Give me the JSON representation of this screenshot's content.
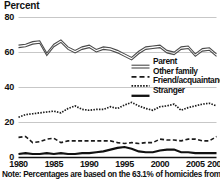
{
  "chart_data": {
    "type": "line",
    "title": "Percent",
    "xlabel": "",
    "ylabel": "Percent",
    "xlim": [
      1980,
      2008
    ],
    "ylim": [
      0,
      80
    ],
    "grid": true,
    "legend_position": "center-right",
    "x": [
      1980,
      1981,
      1982,
      1983,
      1984,
      1985,
      1986,
      1987,
      1988,
      1989,
      1990,
      1991,
      1992,
      1993,
      1994,
      1995,
      1996,
      1997,
      1998,
      1999,
      2000,
      2001,
      2002,
      2003,
      2004,
      2005,
      2006,
      2007,
      2008
    ],
    "xticks": [
      "1980",
      "1985",
      "1990",
      "1995",
      "2000",
      "2005",
      "2008"
    ],
    "xtick_values": [
      1980,
      1985,
      1990,
      1995,
      2000,
      2005,
      2008
    ],
    "yticks": [
      "0",
      "20",
      "40",
      "60",
      "80"
    ],
    "ytick_values": [
      0,
      20,
      40,
      60,
      80
    ],
    "series": [
      {
        "name": "Parent",
        "style": "double-line",
        "color": "#555555",
        "values": [
          63.5,
          64.0,
          65.5,
          66.0,
          59.0,
          64.0,
          66.5,
          62.5,
          60.5,
          62.5,
          63.5,
          61.0,
          62.5,
          62.0,
          60.5,
          58.5,
          56.5,
          60.0,
          62.5,
          63.0,
          63.5,
          60.5,
          59.5,
          62.5,
          63.0,
          58.5,
          61.5,
          62.0,
          58.5
        ]
      },
      {
        "name": "Other family",
        "style": "dashed",
        "color": "#1a1a1a",
        "values": [
          11.5,
          12.0,
          8.5,
          9.0,
          10.5,
          11.0,
          8.5,
          9.5,
          9.5,
          9.5,
          9.5,
          9.5,
          9.5,
          9.5,
          8.5,
          8.0,
          8.5,
          8.0,
          8.5,
          8.5,
          10.5,
          10.0,
          10.0,
          9.5,
          10.5,
          10.5,
          9.5,
          9.5,
          12.0
        ]
      },
      {
        "name": "Friend/acquaintance",
        "style": "dotted",
        "color": "#1a1a1a",
        "values": [
          23.0,
          24.5,
          25.0,
          25.5,
          26.0,
          26.5,
          25.5,
          28.0,
          29.5,
          27.5,
          27.0,
          27.5,
          27.5,
          29.0,
          28.0,
          30.0,
          31.5,
          29.5,
          28.0,
          27.0,
          29.0,
          29.5,
          30.5,
          27.0,
          28.5,
          29.5,
          30.5,
          31.0,
          29.5
        ]
      },
      {
        "name": "Stranger",
        "style": "solid-bold",
        "color": "#111111",
        "values": [
          2.0,
          2.5,
          2.0,
          2.0,
          2.5,
          2.0,
          2.5,
          2.0,
          2.0,
          2.5,
          2.5,
          3.0,
          3.5,
          4.5,
          5.5,
          6.0,
          5.0,
          3.5,
          3.0,
          3.0,
          4.0,
          4.5,
          4.5,
          3.0,
          3.0,
          2.5,
          2.5,
          2.5,
          2.5
        ]
      }
    ],
    "note": "Note: Percentages are based on the 63.1% of homicides from 1980"
  },
  "legend": {
    "items": [
      {
        "label": "Parent"
      },
      {
        "label": "Other family"
      },
      {
        "label": "Friend/acquaintance"
      },
      {
        "label": "Stranger"
      }
    ]
  },
  "colors": {
    "gridline": "#b9b9b9",
    "axis": "#111111",
    "background": "#ffffff",
    "text": "#111111"
  }
}
